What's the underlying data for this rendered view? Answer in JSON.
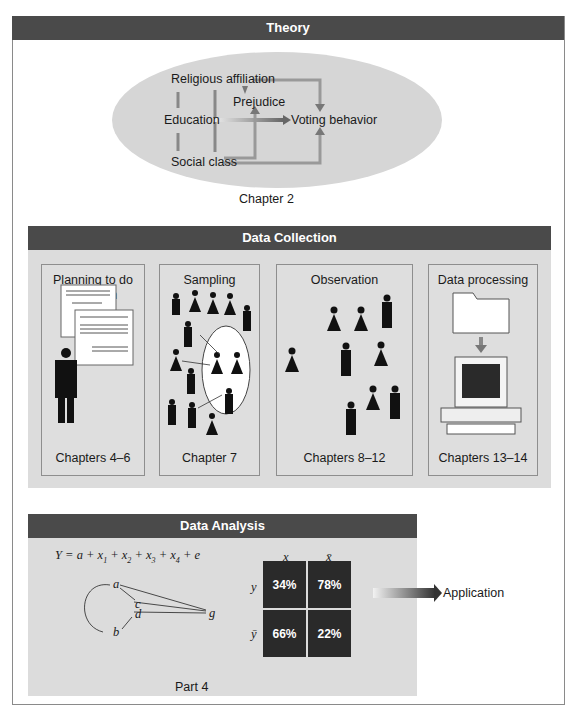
{
  "theory": {
    "header": "Theory",
    "nodes": {
      "religious_affiliation": "Religious affiliation",
      "prejudice": "Prejudice",
      "education": "Education",
      "voting_behavior": "Voting behavior",
      "social_class": "Social class"
    },
    "caption": "Chapter 2"
  },
  "data_collection": {
    "header": "Data Collection",
    "cards": [
      {
        "title": "Planning to do research",
        "footer": "Chapters 4–6",
        "icon": "documents-and-person-icon"
      },
      {
        "title": "Sampling",
        "footer": "Chapter 7",
        "icon": "population-sample-icon"
      },
      {
        "title": "Observation",
        "footer": "Chapters 8–12",
        "icon": "people-icon"
      },
      {
        "title": "Data processing",
        "footer": "Chapters 13–14",
        "icon": "folder-to-computer-icon"
      }
    ]
  },
  "data_analysis": {
    "header": "Data Analysis",
    "equation": {
      "lhs": "Y = ",
      "terms": [
        "a",
        "x1",
        "x2",
        "x3",
        "x4",
        "e"
      ]
    },
    "path_nodes": [
      "a",
      "c",
      "d",
      "b",
      "g"
    ],
    "table": {
      "col_headers": [
        "x",
        "x̄"
      ],
      "row_headers": [
        "y",
        "ȳ"
      ],
      "cells": [
        [
          "34%",
          "78%"
        ],
        [
          "66%",
          "22%"
        ]
      ]
    },
    "caption": "Part 4"
  },
  "application": {
    "label": "Application"
  },
  "colors": {
    "header_bar": "#4a4a4a",
    "panel_bg": "#dcdcdc",
    "ellipse": "#d6d6d6",
    "table_cell": "#2a2a2a"
  }
}
